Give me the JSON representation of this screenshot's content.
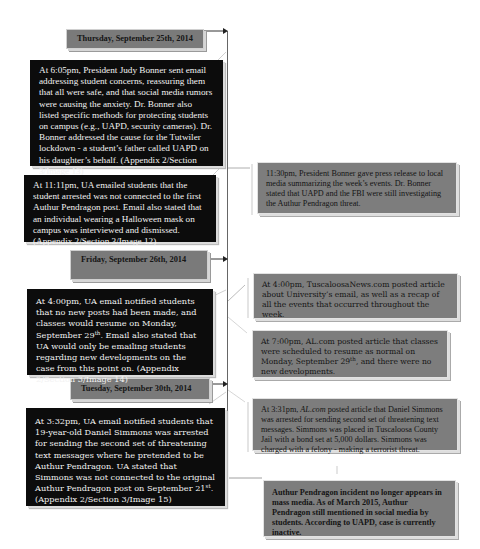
{
  "timeline": {
    "dates": [
      {
        "label": "Thursday, September 25th, 2014"
      },
      {
        "label": "Friday, September 26th, 2014"
      },
      {
        "label": "Tuesday, September 30th, 2014"
      }
    ],
    "university_events": [
      {
        "text": "At 6:05pm, President Judy Bonner sent email addressing student concerns, reassuring them that all were safe, and that social media rumors were causing the anxiety. Dr. Bonner also listed specific methods for protecting students on campus (e.g., UAPD, security cameras). Dr. Bonner addressed the cause for the Tutwiler lockdown - a student’s father called UAPD on his daughter’s behalf. (Appendix 2/Section 3/Image 13)"
      },
      {
        "text": "At 11:11pm, UA emailed students that the student arrested was not connected to the first Authur Pendragon post. Email also stated that an individual wearing a Halloween mask on campus was interviewed and dismissed. (Appendix 2/Section 3/Image 12)"
      },
      {
        "text_before": "At 4:00pm, UA email notified students that no new posts had been made, and classes would resume on Monday, September 29",
        "sup": "th",
        "text_after": ". Email also stated that UA would only be emailing students regarding new developments on the case from this point on. (Appendix 2/Section 3/Image 14)"
      },
      {
        "text_before": "At 3:32pm, UA email notified students that 19-year-old Daniel Simmons was arrested for sending the second set of threatening text messages where he pretended to be Authur Pendragon. UA stated that Simmons was not connected to the original Authur Pendragon post on September 21",
        "sup": "st",
        "text_after": ".  (Appendix 2/Section 3/Image 15)"
      }
    ],
    "media_events": [
      {
        "text": "11:30pm, President Bonner gave press release to local media summarizing the week’s events.  Dr. Bonner stated that UAPD and the FBI were still investigating the Authur Pendragon threat."
      },
      {
        "text": "At 4:00pm, TuscaloosaNews.com posted article about University’s email, as well as a recap of all the events that occurred throughout the week."
      },
      {
        "text_before": "At 7:00pm, AL.com posted article that classes were scheduled to resume as normal on Monday, September 29",
        "sup": "th",
        "text_after": ", and there were no new developments."
      },
      {
        "prefix": "At 3:31pm, ",
        "italic": "AL.com",
        "text_after": " posted article that Daniel Simmons was arrested for sending second set of threatening text messages. Simmons was placed in Tuscaloosa County Jail with a bond set at 5,000 dollars. Simmons was charged with a felony - making a terrorist threat."
      },
      {
        "text": "Authur Pendragon incident no longer appears in mass media. As of March 2015, Authur Pendragon still mentioned in social media by students. According to UAPD, case is currently inactive."
      }
    ]
  },
  "colors": {
    "date_header_bg": "#7a7a7a",
    "university_box_bg": "#0c0c0c",
    "media_box_bg": "#7d7d7d",
    "connector": "#555555"
  }
}
